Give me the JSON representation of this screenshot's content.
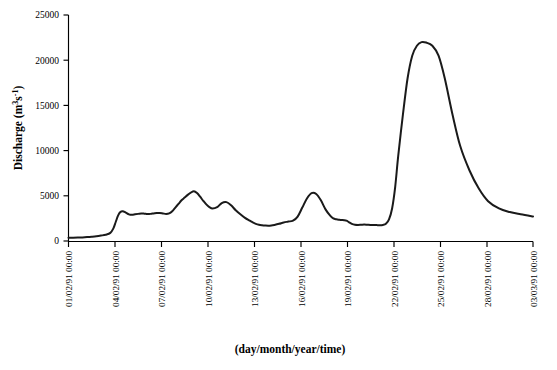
{
  "chart_data": {
    "type": "line",
    "title": "",
    "subtitle": "",
    "xlabel": "(day/month/year/time)",
    "ylabel": "Discharge (m³s⁻¹)",
    "ylabel_parts": {
      "base": "Discharge (m",
      "sup1": "3",
      "mid": "s",
      "sup2": "-1",
      "close": ")"
    },
    "grid": false,
    "legend": "none",
    "ylim": [
      0,
      25000
    ],
    "ytick_labels": [
      "0",
      "5000",
      "10000",
      "15000",
      "20000",
      "25000"
    ],
    "ytick_values": [
      0,
      5000,
      10000,
      15000,
      20000,
      25000
    ],
    "xtick_labels": [
      "01/02/91 00:00",
      "04/02/91 00:00",
      "07/02/91 00:00",
      "10/02/91 00:00",
      "13/02/91 00:00",
      "16/02/91 00:00",
      "19/02/91 00:00",
      "22/02/91 00:00",
      "25/02/91 00:00",
      "28/02/91 00:00",
      "03/03/91 00:00"
    ],
    "xtick_days": [
      0,
      3,
      6,
      9,
      12,
      15,
      18,
      21,
      24,
      27,
      30
    ],
    "xlim_days": [
      0,
      30
    ],
    "series": [
      {
        "name": "Discharge",
        "color": "#1a1a1a",
        "x_days": [
          0.0,
          0.3,
          0.6,
          0.9,
          1.2,
          1.5,
          1.8,
          2.1,
          2.4,
          2.7,
          2.9,
          3.05,
          3.2,
          3.35,
          3.5,
          3.7,
          3.9,
          4.1,
          4.3,
          4.5,
          4.7,
          4.9,
          5.1,
          5.3,
          5.5,
          5.7,
          5.9,
          6.1,
          6.3,
          6.5,
          6.7,
          6.9,
          7.1,
          7.3,
          7.5,
          7.7,
          7.9,
          8.1,
          8.3,
          8.5,
          8.7,
          8.9,
          9.1,
          9.3,
          9.6,
          9.9,
          10.2,
          10.5,
          10.8,
          11.1,
          11.4,
          11.7,
          11.9,
          12.1,
          12.3,
          12.5,
          12.7,
          12.9,
          13.1,
          13.3,
          13.6,
          13.9,
          14.2,
          14.5,
          14.8,
          15.1,
          15.4,
          15.7,
          16.0,
          16.3,
          16.6,
          16.9,
          17.1,
          17.3,
          17.5,
          17.65,
          17.8,
          17.95,
          18.1,
          18.3,
          18.5,
          18.7,
          18.9,
          19.1,
          19.3,
          19.5,
          19.7,
          19.9,
          20.1,
          20.3,
          20.5,
          20.7,
          20.9,
          21.1,
          21.3,
          21.6,
          21.9,
          22.2,
          22.5,
          22.8,
          23.1,
          23.5,
          23.9,
          24.3,
          24.8,
          25.3,
          25.9,
          26.5,
          27.1,
          27.8,
          28.5,
          29.2,
          30.0
        ],
        "y_values": [
          350,
          360,
          380,
          400,
          430,
          470,
          520,
          600,
          700,
          900,
          1400,
          2100,
          2800,
          3200,
          3300,
          3150,
          2950,
          2900,
          2950,
          3000,
          3050,
          3020,
          2980,
          3000,
          3050,
          3100,
          3100,
          3050,
          3000,
          3050,
          3300,
          3700,
          4100,
          4500,
          4800,
          5100,
          5350,
          5500,
          5300,
          4900,
          4450,
          4050,
          3750,
          3600,
          3750,
          4200,
          4300,
          3950,
          3400,
          2950,
          2550,
          2250,
          2050,
          1900,
          1800,
          1750,
          1720,
          1700,
          1720,
          1780,
          1900,
          2050,
          2150,
          2250,
          2700,
          3700,
          4700,
          5300,
          5200,
          4500,
          3500,
          2800,
          2500,
          2400,
          2350,
          2320,
          2300,
          2250,
          2100,
          1900,
          1800,
          1780,
          1800,
          1820,
          1800,
          1780,
          1770,
          1760,
          1750,
          1780,
          1900,
          2400,
          3600,
          6000,
          9500,
          14000,
          18000,
          20500,
          21600,
          22000,
          21950,
          21600,
          20500,
          18000,
          14000,
          10500,
          7800,
          5800,
          4400,
          3600,
          3200,
          2950,
          2700
        ]
      }
    ],
    "series_tail": {
      "name": "Discharge (recession tail)",
      "x_days": [
        22.0,
        22.3,
        22.6,
        22.9,
        23.2,
        23.5,
        23.8,
        24.1,
        24.4,
        24.7,
        25.0,
        25.4,
        25.8,
        26.2,
        26.7,
        27.2,
        27.8,
        28.4,
        29.0,
        29.6,
        30.0
      ],
      "y_values": [
        8200,
        6200,
        4800,
        3900,
        3350,
        3050,
        2850,
        2650,
        2450,
        2250,
        2050,
        1800,
        1600,
        1400,
        1200,
        1050,
        900,
        780,
        680,
        600,
        560
      ]
    },
    "peak": {
      "value": 22000,
      "x_day": 19.0,
      "label": ""
    }
  },
  "figure": {
    "background_color": "#ffffff",
    "line_color": "#1a1a1a",
    "axis_color": "#000000"
  }
}
